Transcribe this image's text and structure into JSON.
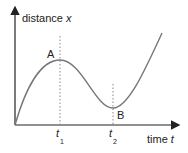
{
  "diagram": {
    "y_axis_label": "distance",
    "y_axis_var": "x",
    "x_axis_label": "time",
    "x_axis_var": "t",
    "points": [
      {
        "label": "A",
        "description": "local maximum"
      },
      {
        "label": "B",
        "description": "local minimum"
      }
    ],
    "ticks": [
      {
        "var": "t",
        "sub": "1"
      },
      {
        "var": "t",
        "sub": "2"
      }
    ],
    "colors": {
      "axes": "#222222",
      "curve": "#777777",
      "guide": "#888888"
    }
  }
}
